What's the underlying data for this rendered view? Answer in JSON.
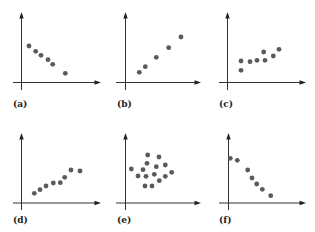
{
  "figure": {
    "background": "#ffffff",
    "axis_color": "#333333",
    "point_color": "#5a5a5a",
    "point_radius": 2.4
  },
  "chart_data": [
    {
      "type": "scatter",
      "label": "(a)",
      "title": "",
      "xlabel": "",
      "ylabel": "",
      "description": "negative linear trend",
      "grid": false,
      "origin": [
        21.5,
        82.5
      ],
      "y_axis": {
        "x": 21.5,
        "top": 12,
        "bottom": 90
      },
      "x_axis": {
        "y": 82.5,
        "left": 13,
        "right": 101
      },
      "label_pos": [
        13,
        107
      ],
      "points": [
        [
          29,
          46
        ],
        [
          35.7,
          51.3
        ],
        [
          41,
          55.3
        ],
        [
          48,
          59.7
        ],
        [
          52.7,
          64.3
        ],
        [
          65.3,
          73.3
        ]
      ]
    },
    {
      "type": "scatter",
      "label": "(b)",
      "title": "",
      "xlabel": "",
      "ylabel": "",
      "description": "positive linear trend",
      "grid": false,
      "y_axis": {
        "x": 125.5,
        "top": 12,
        "bottom": 90
      },
      "x_axis": {
        "y": 82.5,
        "left": 116,
        "right": 201
      },
      "label_pos": [
        117,
        107
      ],
      "points": [
        [
          139.3,
          72.3
        ],
        [
          145.3,
          66.7
        ],
        [
          156.3,
          57.3
        ],
        [
          168.7,
          47.7
        ],
        [
          181,
          37
        ]
      ]
    },
    {
      "type": "scatter",
      "label": "(c)",
      "title": "",
      "xlabel": "",
      "ylabel": "",
      "description": "weak positive trend",
      "grid": false,
      "y_axis": {
        "x": 227.5,
        "top": 12,
        "bottom": 90
      },
      "x_axis": {
        "y": 82.5,
        "left": 219,
        "right": 306
      },
      "label_pos": [
        219,
        107
      ],
      "points": [
        [
          241,
          61
        ],
        [
          241,
          70.3
        ],
        [
          250,
          61.7
        ],
        [
          257,
          60.3
        ],
        [
          263.7,
          52
        ],
        [
          265,
          60.3
        ],
        [
          273.3,
          56
        ],
        [
          279,
          49.3
        ]
      ]
    },
    {
      "type": "scatter",
      "label": "(d)",
      "title": "",
      "xlabel": "",
      "ylabel": "",
      "description": "positive trend",
      "grid": false,
      "y_axis": {
        "x": 21.5,
        "top": 133,
        "bottom": 210
      },
      "x_axis": {
        "y": 203,
        "left": 13,
        "right": 101
      },
      "label_pos": [
        13,
        223
      ],
      "points": [
        [
          34.3,
          193.3
        ],
        [
          40,
          189.7
        ],
        [
          46,
          186
        ],
        [
          53.3,
          183
        ],
        [
          60.3,
          182.7
        ],
        [
          64.7,
          177.3
        ],
        [
          71,
          170
        ],
        [
          80,
          171
        ]
      ]
    },
    {
      "type": "scatter",
      "label": "(e)",
      "title": "",
      "xlabel": "",
      "ylabel": "",
      "description": "no correlation",
      "grid": false,
      "y_axis": {
        "x": 125.5,
        "top": 133,
        "bottom": 210
      },
      "x_axis": {
        "y": 203,
        "left": 116,
        "right": 201
      },
      "label_pos": [
        117,
        223
      ],
      "points": [
        [
          147.7,
          155
        ],
        [
          159,
          157
        ],
        [
          147,
          163.3
        ],
        [
          156.3,
          166.7
        ],
        [
          165.3,
          165
        ],
        [
          131.3,
          169
        ],
        [
          143,
          169.7
        ],
        [
          154.3,
          174.3
        ],
        [
          138,
          176
        ],
        [
          146,
          176.3
        ],
        [
          165.3,
          176.3
        ],
        [
          171.7,
          172.3
        ],
        [
          159.3,
          180.7
        ],
        [
          145,
          186
        ],
        [
          152,
          186
        ]
      ]
    },
    {
      "type": "scatter",
      "label": "(f)",
      "title": "",
      "xlabel": "",
      "ylabel": "",
      "description": "negative trend",
      "grid": false,
      "y_axis": {
        "x": 228.5,
        "top": 133,
        "bottom": 210
      },
      "x_axis": {
        "y": 203,
        "left": 219,
        "right": 306
      },
      "label_pos": [
        219,
        223
      ],
      "points": [
        [
          230.3,
          158.3
        ],
        [
          237.3,
          160.3
        ],
        [
          247.7,
          170
        ],
        [
          252,
          178
        ],
        [
          256.7,
          184
        ],
        [
          262.3,
          189.3
        ],
        [
          270.7,
          195.7
        ]
      ]
    }
  ]
}
